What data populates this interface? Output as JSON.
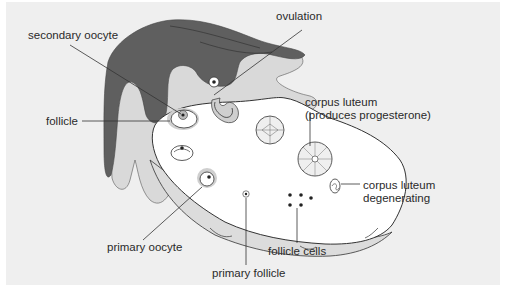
{
  "diagram": {
    "colors": {
      "background": "#efefef",
      "fallopian_dark": "#5f5f5f",
      "fallopian_light": "#d9d9d9",
      "ovary_fill": "#ffffff",
      "ovary_lower_band": "#dcdcdc",
      "halo": "#c8c8c8",
      "outline": "#333333",
      "label_text": "#2a2a2a"
    },
    "labels": {
      "secondary_oocyte": "secondary oocyte",
      "follicle": "follicle",
      "ovulation": "ovulation",
      "corpus_luteum_1": "corpus luteum",
      "corpus_luteum_2": "(produces progesterone)",
      "corpus_luteum_degen_1": "corpus luteum",
      "corpus_luteum_degen_2": "degenerating",
      "primary_oocyte": "primary oocyte",
      "follicle_cells": "follicle cells",
      "primary_follicle": "primary follicle"
    }
  }
}
